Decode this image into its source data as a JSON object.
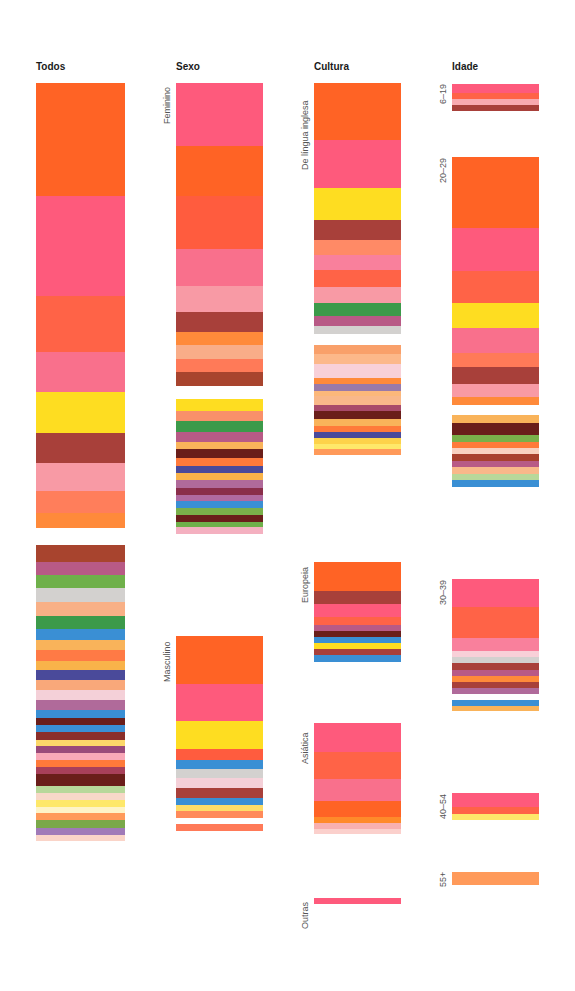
{
  "chart_data": {
    "type": "stacked-bar-mosaic",
    "title": "",
    "columns": [
      {
        "title": "Todos",
        "x": 36,
        "width": 89,
        "groups": [
          {
            "label": "",
            "bands": [
              [
                83,
                113,
                "#ff6325"
              ],
              [
                196,
                100,
                "#fe5a7c"
              ],
              [
                296,
                56,
                "#ff6347"
              ],
              [
                352,
                40,
                "#f9708c"
              ],
              [
                392,
                41,
                "#fedd21"
              ],
              [
                433,
                30,
                "#a8403a"
              ],
              [
                463,
                28,
                "#f89aa5"
              ],
              [
                491,
                22,
                "#ff7e5b"
              ],
              [
                513,
                15,
                "#ff8a3a"
              ]
            ]
          },
          {
            "label": "",
            "bands": [
              [
                545,
                17,
                "#a8442e"
              ],
              [
                562,
                13,
                "#b85a86"
              ],
              [
                575,
                13,
                "#6fb04a"
              ],
              [
                588,
                14,
                "#d3d1cf"
              ],
              [
                602,
                14,
                "#f8b086"
              ],
              [
                616,
                13,
                "#3c9a4a"
              ],
              [
                629,
                11,
                "#3a8fd4"
              ],
              [
                640,
                10,
                "#f9b35a"
              ],
              [
                650,
                11,
                "#ff7a45"
              ],
              [
                661,
                9,
                "#f9b34a"
              ],
              [
                670,
                10,
                "#4a4a9a"
              ],
              [
                680,
                10,
                "#f9a87a"
              ],
              [
                690,
                10,
                "#f4d0d8"
              ],
              [
                700,
                10,
                "#b06a9a"
              ],
              [
                710,
                8,
                "#3a8fd4"
              ],
              [
                718,
                7,
                "#6a1e1a"
              ],
              [
                725,
                7,
                "#3a8fd4"
              ],
              [
                732,
                8,
                "#8a2e2a"
              ],
              [
                740,
                6,
                "#fcd86a"
              ],
              [
                746,
                7,
                "#9a4a7a"
              ],
              [
                753,
                7,
                "#f9a8b8"
              ],
              [
                760,
                7,
                "#ff7a3a"
              ],
              [
                767,
                7,
                "#a8405a"
              ],
              [
                774,
                12,
                "#6a1e1a"
              ],
              [
                786,
                7,
                "#b8d89a"
              ],
              [
                793,
                7,
                "#f8d8c8"
              ],
              [
                800,
                7,
                "#fee86a"
              ],
              [
                807,
                6,
                "#fef4c8"
              ],
              [
                813,
                7,
                "#ff9a5a"
              ],
              [
                820,
                8,
                "#7aa84a"
              ],
              [
                828,
                7,
                "#a07ab8"
              ],
              [
                835,
                6,
                "#fad4c8"
              ]
            ]
          }
        ]
      },
      {
        "title": "Sexo",
        "x": 176,
        "width": 87,
        "groups": [
          {
            "label": "Feminino",
            "bands": [
              [
                83,
                63,
                "#fe5a7c"
              ],
              [
                146,
                50,
                "#ff6325"
              ],
              [
                196,
                53,
                "#ff5c3e"
              ],
              [
                249,
                37,
                "#f9708c"
              ],
              [
                286,
                26,
                "#f89aa5"
              ],
              [
                312,
                20,
                "#a8403a"
              ],
              [
                332,
                13,
                "#ff8a3a"
              ],
              [
                345,
                14,
                "#f9ad88"
              ],
              [
                359,
                13,
                "#ff7a58"
              ],
              [
                372,
                14,
                "#a8442e"
              ]
            ]
          },
          {
            "label": "",
            "bands": [
              [
                399,
                12,
                "#fedd21"
              ],
              [
                411,
                10,
                "#f9906a"
              ],
              [
                421,
                11,
                "#3c9a4a"
              ],
              [
                432,
                10,
                "#b85a86"
              ],
              [
                442,
                7,
                "#f9b35a"
              ],
              [
                449,
                9,
                "#6a1e1a"
              ],
              [
                458,
                8,
                "#ff7a3a"
              ],
              [
                466,
                7,
                "#4a4a9a"
              ],
              [
                473,
                7,
                "#f9b34a"
              ],
              [
                480,
                8,
                "#b06a9a"
              ],
              [
                488,
                7,
                "#8a2e4a"
              ],
              [
                495,
                6,
                "#b06aa0"
              ],
              [
                501,
                7,
                "#3a8fd4"
              ],
              [
                508,
                7,
                "#7ab04a"
              ],
              [
                515,
                7,
                "#6a1e1a"
              ],
              [
                522,
                5,
                "#6fb04a"
              ],
              [
                527,
                7,
                "#f4b0c0"
              ]
            ]
          },
          {
            "label": "Masculino",
            "bands": [
              [
                636,
                48,
                "#ff6325"
              ],
              [
                684,
                37,
                "#fe5a7c"
              ],
              [
                721,
                28,
                "#fedd21"
              ],
              [
                749,
                11,
                "#ff5c3e"
              ],
              [
                760,
                9,
                "#3a8fd4"
              ],
              [
                769,
                9,
                "#d3d1cf"
              ],
              [
                778,
                10,
                "#f4d0d8"
              ],
              [
                788,
                10,
                "#a8403a"
              ],
              [
                798,
                7,
                "#3a8fd4"
              ],
              [
                805,
                6,
                "#fedd68"
              ],
              [
                811,
                7,
                "#ff8a5a"
              ],
              [
                824,
                7,
                "#ff7a58"
              ]
            ]
          }
        ]
      },
      {
        "title": "Cultura",
        "x": 314,
        "width": 87,
        "groups": [
          {
            "label": "De língua inglesa",
            "bands": [
              [
                83,
                57,
                "#ff6325"
              ],
              [
                140,
                48,
                "#fe5a7c"
              ],
              [
                188,
                32,
                "#fedd21"
              ],
              [
                220,
                20,
                "#a8403a"
              ],
              [
                240,
                15,
                "#ff8a66"
              ],
              [
                255,
                15,
                "#f9809c"
              ],
              [
                270,
                17,
                "#ff6347"
              ],
              [
                287,
                16,
                "#f89aa5"
              ],
              [
                303,
                13,
                "#3c9a4a"
              ],
              [
                316,
                10,
                "#b85a86"
              ],
              [
                326,
                8,
                "#d3d1cf"
              ]
            ]
          },
          {
            "label": "",
            "bands": [
              [
                345,
                9,
                "#f9a06a"
              ],
              [
                354,
                10,
                "#fcb88a"
              ],
              [
                364,
                14,
                "#f8d0d8"
              ],
              [
                378,
                6,
                "#ff8a3a"
              ],
              [
                384,
                7,
                "#9a7aa8"
              ],
              [
                391,
                5,
                "#fcb87a"
              ],
              [
                396,
                9,
                "#f9b88a"
              ],
              [
                405,
                6,
                "#a84a6a"
              ],
              [
                411,
                8,
                "#6a1e1a"
              ],
              [
                419,
                7,
                "#f9b35a"
              ],
              [
                426,
                6,
                "#ff7a3a"
              ],
              [
                432,
                6,
                "#4a4a9a"
              ],
              [
                438,
                6,
                "#fdd24a"
              ],
              [
                444,
                5,
                "#fee86a"
              ],
              [
                449,
                6,
                "#ff9a5a"
              ]
            ]
          },
          {
            "label": "Europeia",
            "bands": [
              [
                562,
                29,
                "#ff6325"
              ],
              [
                591,
                13,
                "#a8403a"
              ],
              [
                604,
                13,
                "#fe5a7c"
              ],
              [
                617,
                8,
                "#ff6347"
              ],
              [
                625,
                6,
                "#b85a86"
              ],
              [
                631,
                6,
                "#6a1e1a"
              ],
              [
                637,
                6,
                "#3a8fd4"
              ],
              [
                643,
                6,
                "#fedd21"
              ],
              [
                649,
                6,
                "#a8403a"
              ],
              [
                655,
                7,
                "#3a8fd4"
              ]
            ]
          },
          {
            "label": "Asiática",
            "bands": [
              [
                723,
                29,
                "#fe5a7c"
              ],
              [
                752,
                27,
                "#ff6347"
              ],
              [
                779,
                22,
                "#f9708c"
              ],
              [
                801,
                16,
                "#ff6325"
              ],
              [
                817,
                6,
                "#ff8a2a"
              ],
              [
                823,
                6,
                "#f8b0b0"
              ],
              [
                829,
                5,
                "#fbd0cc"
              ]
            ]
          },
          {
            "label": "Outras",
            "bands": [
              [
                898,
                6,
                "#fe5a7c"
              ]
            ]
          }
        ]
      },
      {
        "title": "Idade",
        "x": 452,
        "width": 87,
        "groups": [
          {
            "label": "6–19",
            "bands": [
              [
                84,
                9,
                "#fe5a7c"
              ],
              [
                93,
                6,
                "#ff6347"
              ],
              [
                99,
                6,
                "#f8aab0"
              ],
              [
                105,
                6,
                "#a8403a"
              ]
            ]
          },
          {
            "label": "20–29",
            "bands": [
              [
                157,
                71,
                "#ff6325"
              ],
              [
                228,
                43,
                "#fe5a7c"
              ],
              [
                271,
                32,
                "#ff6347"
              ],
              [
                303,
                25,
                "#fedd21"
              ],
              [
                328,
                25,
                "#f9708c"
              ],
              [
                353,
                14,
                "#ff7a58"
              ],
              [
                367,
                17,
                "#a8403a"
              ],
              [
                384,
                13,
                "#f89aa5"
              ],
              [
                397,
                8,
                "#ff8a3a"
              ]
            ]
          },
          {
            "label": "",
            "bands": [
              [
                415,
                8,
                "#f9b35a"
              ],
              [
                423,
                12,
                "#6a1e1a"
              ],
              [
                435,
                7,
                "#7ab04a"
              ],
              [
                442,
                6,
                "#ff7a3a"
              ],
              [
                448,
                6,
                "#f8d0c0"
              ],
              [
                454,
                7,
                "#a8402e"
              ],
              [
                461,
                6,
                "#b85a86"
              ],
              [
                467,
                7,
                "#f9b88a"
              ],
              [
                474,
                6,
                "#b8d89a"
              ],
              [
                480,
                7,
                "#3a8fd4"
              ]
            ]
          },
          {
            "label": "30–39",
            "bands": [
              [
                579,
                28,
                "#fe5a7c"
              ],
              [
                607,
                31,
                "#ff6347"
              ],
              [
                638,
                13,
                "#f9809c"
              ],
              [
                651,
                6,
                "#f8d0d8"
              ],
              [
                657,
                6,
                "#d3d1cf"
              ],
              [
                663,
                7,
                "#a8403a"
              ],
              [
                670,
                6,
                "#b85a86"
              ],
              [
                676,
                6,
                "#ff8a3a"
              ],
              [
                682,
                6,
                "#a8403a"
              ],
              [
                688,
                6,
                "#b06a9a"
              ],
              [
                700,
                6,
                "#3a8fd4"
              ],
              [
                706,
                5,
                "#f9b35a"
              ]
            ]
          },
          {
            "label": "40–54",
            "bands": [
              [
                793,
                14,
                "#fe5a7c"
              ],
              [
                807,
                7,
                "#ff6347"
              ],
              [
                814,
                6,
                "#fee86a"
              ]
            ]
          },
          {
            "label": "55+",
            "bands": [
              [
                872,
                13,
                "#ff9a5a"
              ]
            ]
          }
        ]
      }
    ]
  }
}
